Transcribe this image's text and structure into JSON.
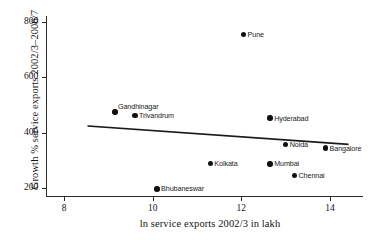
{
  "chart_data": {
    "type": "scatter",
    "title": "",
    "xlabel": "ln service exports 2002/3 in lakh",
    "ylabel": "Growth % service exports 2002/3–2006/7",
    "xlim": [
      7.6,
      14.75
    ],
    "ylim": [
      170,
      820
    ],
    "xticks": [
      8,
      10,
      12,
      14
    ],
    "yticks": [
      200,
      400,
      600,
      800
    ],
    "grid": false,
    "legend": "none",
    "points": [
      {
        "label": "Gandhinagar",
        "x": 9.15,
        "y": 475
      },
      {
        "label": "Trivandrum",
        "x": 9.6,
        "y": 461
      },
      {
        "label": "Bhubaneswar",
        "x": 10.1,
        "y": 197
      },
      {
        "label": "Kolkata",
        "x": 11.3,
        "y": 288
      },
      {
        "label": "Pune",
        "x": 12.05,
        "y": 755
      },
      {
        "label": "Hyderabad",
        "x": 12.65,
        "y": 453
      },
      {
        "label": "Mumbai",
        "x": 12.65,
        "y": 287
      },
      {
        "label": "Noida",
        "x": 13.0,
        "y": 358
      },
      {
        "label": "Chennai",
        "x": 13.2,
        "y": 246
      },
      {
        "label": "Bangalore",
        "x": 13.9,
        "y": 344
      }
    ],
    "trendline": {
      "type": "linear-fit",
      "x_start": 8.55,
      "y_start": 424,
      "x_end": 14.4,
      "y_end": 358
    },
    "marker_color": "#111111",
    "line_color": "#1a1a1a",
    "axis_color": "#2b2b2b"
  }
}
